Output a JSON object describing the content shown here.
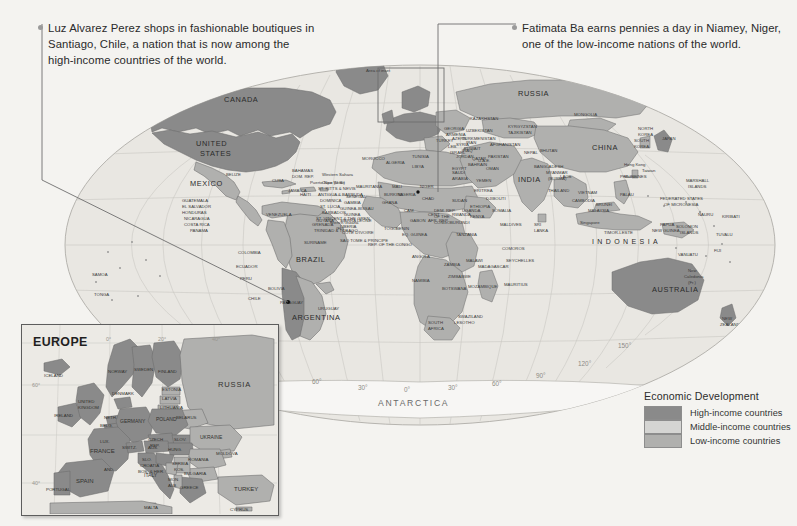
{
  "annotations": [
    {
      "id": "callout-left",
      "name": "callout-santiago",
      "text": "Luz Alvarez Perez shops in fashionable boutiques in Santiago, Chile, a nation that is now among the high-income countries of the world.",
      "target": "Santiago, Chile"
    },
    {
      "id": "callout-right",
      "name": "callout-niamey",
      "text": "Fatimata Ba earns pennies a day in Niamey, Niger, one of the low-income nations of the world.",
      "target": "Niamey, Niger"
    }
  ],
  "legend": {
    "title": "Economic Development",
    "items": [
      {
        "label": "High-income countries",
        "color": "#8a8a8a"
      },
      {
        "label": "Middle-income countries",
        "color": "#d5d5d3"
      },
      {
        "label": "Low-income countries",
        "color": "#b0b0ae"
      }
    ]
  },
  "inset": {
    "title": "EUROPE",
    "note": "Area of inset",
    "lat_labels": [
      "60°",
      "40°"
    ],
    "lon_labels": [
      "20°",
      "0°",
      "20°",
      "40°"
    ],
    "countries": [
      "ICELAND",
      "NORWAY",
      "SWEDEN",
      "FINLAND",
      "ESTONIA",
      "LATVIA",
      "LITHUANIA",
      "RUSSIA",
      "IRELAND",
      "UNITED KINGDOM",
      "DENMARK",
      "NETH",
      "BELG",
      "GERMANY",
      "POLAND",
      "BELARUS",
      "LUX",
      "CZECH REP",
      "SLOVAKIA",
      "UKRAINE",
      "MOLDOVA",
      "AUS",
      "HUNG",
      "ROMANIA",
      "SWITZ",
      "FRANCE",
      "SLO",
      "CROATIA",
      "BOS. & HER.",
      "SERBIA",
      "BULGARIA",
      "MAC",
      "ALB",
      "ITALY",
      "GREECE",
      "KOS",
      "MON",
      "PORTUGAL",
      "SPAIN",
      "TURKEY",
      "CYPRUS",
      "MALTA",
      "AND"
    ]
  },
  "map": {
    "ocean_color": "#e9e7e2",
    "page_color": "#f4f3f0",
    "lat_labels": [
      "30°",
      "0°",
      "30°"
    ],
    "lon_labels": [
      "150°",
      "120°",
      "90°",
      "60°",
      "30°",
      "0°",
      "30°",
      "60°",
      "90°",
      "120°",
      "150°"
    ],
    "continent_labels": [
      "ANTARCTICA",
      "INDONESIA"
    ],
    "regions": {
      "north_america": [
        "CANADA",
        "UNITED STATES",
        "MEXICO",
        "U.S.",
        "Greenland (Dan.)",
        "BELIZE",
        "CUBA",
        "BAHAMAS",
        "JAMAICA",
        "HAITI",
        "DOM. REP.",
        "Puerto Rico (U.S.)",
        "GUATEMALA",
        "EL SALVADOR",
        "HONDURAS",
        "NICARAGUA",
        "COSTA RICA",
        "PANAMA",
        "ST. KITTS & NEVIS",
        "ANTIGUA & BARBUDA",
        "DOMINICA",
        "ST. LUCIA",
        "BARBADOS",
        "ST. VINCENT & THE GRENADINES",
        "GRENADA",
        "TRINIDAD & TOBAGO"
      ],
      "south_america": [
        "COLOMBIA",
        "VENEZUELA",
        "GUYANA",
        "SURINAME",
        "French Guiana (Fr.)",
        "ECUADOR",
        "PERU",
        "BRAZIL",
        "BOLIVIA",
        "PARAGUAY",
        "CHILE",
        "ARGENTINA",
        "URUGUAY"
      ],
      "europe_africa": [
        "MOROCCO",
        "Western Sahara",
        "ALGERIA",
        "TUNISIA",
        "LIBYA",
        "EGYPT",
        "MAURITANIA",
        "MALI",
        "NIGER",
        "CHAD",
        "SUDAN",
        "SENEGAL",
        "GAMBIA",
        "GUINEA-BISSAU",
        "GUINEA",
        "SIERRA LEONE",
        "LIBERIA",
        "CÔTE D'IVOIRE",
        "BURKINA FASO",
        "GHANA",
        "TOGO",
        "BENIN",
        "NIGERIA",
        "CAMEROON",
        "EQ. GUINEA",
        "GABON",
        "REP. OF THE CONGO",
        "DEM. REP. OF THE CONGO",
        "CENT. AFR. REP.",
        "SOUTH SUDAN",
        "ETHIOPIA",
        "ERITREA",
        "DJIBOUTI",
        "SOMALIA",
        "UGANDA",
        "KENYA",
        "RWANDA",
        "BURUNDI",
        "TANZANIA",
        "ANGOLA",
        "ZAMBIA",
        "MALAWI",
        "MOZAMBIQUE",
        "ZIMBABWE",
        "BOTSWANA",
        "NAMIBIA",
        "SOUTH AFRICA",
        "SWAZILAND",
        "LESOTHO",
        "MADAGASCAR",
        "COMOROS",
        "SEYCHELLES",
        "MAURITIUS",
        "SAO TOME & PRINCIPE",
        "CAPE VERDE"
      ],
      "asia": [
        "RUSSIA",
        "KAZAKHSTAN",
        "MONGOLIA",
        "CHINA",
        "UZBEKISTAN",
        "TURKMENISTAN",
        "KYRGYZSTAN",
        "TAJIKISTAN",
        "AFGHANISTAN",
        "PAKISTAN",
        "IRAN",
        "IRAQ",
        "SYRIA",
        "TURKEY",
        "GEORGIA",
        "ARMENIA",
        "AZERBAIJAN",
        "LEBANON",
        "ISRAEL",
        "JORDAN",
        "SAUDI ARABIA",
        "KUWAIT",
        "QATAR",
        "BAHRAIN",
        "U.A.E.",
        "OMAN",
        "YEMEN",
        "INDIA",
        "NEPAL",
        "BHUTAN",
        "BANGLADESH",
        "MYANMAR (BURMA)",
        "SRI LANKA",
        "MALDIVES",
        "THAILAND",
        "LAOS",
        "VIETNAM",
        "CAMBODIA",
        "MALAYSIA",
        "SINGAPORE",
        "BRUNEI",
        "PHILIPPINES",
        "NORTH KOREA",
        "SOUTH KOREA",
        "JAPAN",
        "Taiwan",
        "Hong Kong",
        "Macao"
      ],
      "oceania": [
        "INDONESIA",
        "TIMOR-LESTE",
        "PAPUA NEW GUINEA",
        "AUSTRALIA",
        "NEW ZEALAND",
        "PALAU",
        "FEDERATED STATES OF MICRONESIA",
        "MARSHALL ISLANDS",
        "NAURU",
        "KIRIBATI",
        "TUVALU",
        "SOLOMON ISLANDS",
        "VANUATU",
        "FIJI",
        "New Caledonia (Fr.)",
        "SAMOA",
        "TONGA"
      ]
    }
  }
}
